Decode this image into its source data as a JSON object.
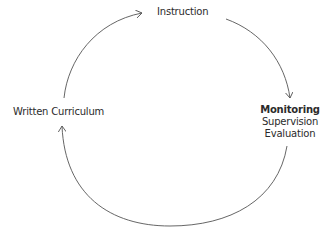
{
  "diagram": {
    "type": "cycle",
    "nodes": [
      {
        "id": "instruction",
        "label": "Instruction"
      },
      {
        "id": "monitoring",
        "title": "Monitoring",
        "lines": [
          "Supervision",
          "Evaluation"
        ]
      },
      {
        "id": "written_curriculum",
        "label": "Written Curriculum"
      }
    ],
    "edges": [
      {
        "from": "written_curriculum",
        "to": "instruction"
      },
      {
        "from": "instruction",
        "to": "monitoring"
      },
      {
        "from": "monitoring",
        "to": "written_curriculum"
      }
    ],
    "colors": {
      "line": "#555555",
      "text": "#2b2b2b",
      "background": "#ffffff"
    }
  }
}
